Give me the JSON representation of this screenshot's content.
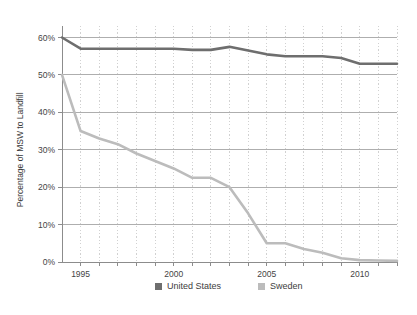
{
  "chart_data": {
    "type": "line",
    "title": "",
    "subtitle": "",
    "xlabel": "",
    "ylabel": "Percentage of MSW to Landfill",
    "xlim": [
      1994,
      2012
    ],
    "ylim": [
      0,
      60
    ],
    "ytick_labels": [
      "0%",
      "10%",
      "20%",
      "30%",
      "40%",
      "50%",
      "60%"
    ],
    "ytick_values": [
      0,
      10,
      20,
      30,
      40,
      50,
      60
    ],
    "xtick_labels": [
      "1995",
      "2000",
      "2005",
      "2010"
    ],
    "xtick_values": [
      1995,
      2000,
      2005,
      2010
    ],
    "grid": {
      "horizontal": true,
      "vertical": true,
      "vertical_style": "dotted"
    },
    "legend": {
      "position": "bottom"
    },
    "x": [
      1994,
      1995,
      1996,
      1997,
      1998,
      1999,
      2000,
      2001,
      2002,
      2003,
      2004,
      2005,
      2006,
      2007,
      2008,
      2009,
      2010,
      2011,
      2012
    ],
    "series": [
      {
        "name": "United States",
        "color": "#6e6e6e",
        "values": [
          60,
          57,
          57,
          57,
          57,
          57,
          57,
          56.7,
          56.7,
          57.5,
          56.5,
          55.5,
          55,
          55,
          55,
          54.5,
          53,
          53,
          53
        ]
      },
      {
        "name": "Sweden",
        "color": "#bcbcbc",
        "values": [
          50,
          35,
          33,
          31.5,
          29,
          27,
          25,
          22.5,
          22.5,
          20,
          13,
          5,
          5,
          3.5,
          2.5,
          1,
          0.5,
          0.4,
          0.3
        ]
      }
    ]
  },
  "legend": {
    "items": [
      {
        "label": "United States",
        "color": "#6e6e6e"
      },
      {
        "label": "Sweden",
        "color": "#bcbcbc"
      }
    ]
  }
}
